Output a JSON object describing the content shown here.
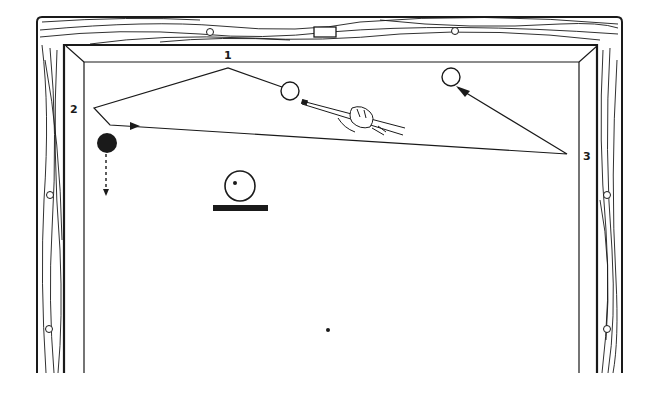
{
  "diagram": {
    "colors": {
      "ink": "#1a1a1a",
      "paper": "#ffffff"
    },
    "cushion_labels": [
      {
        "id": "1",
        "text": "1",
        "x": 228,
        "y": 58
      },
      {
        "id": "2",
        "text": "2",
        "x": 75,
        "y": 113
      },
      {
        "id": "3",
        "text": "3",
        "x": 587,
        "y": 159
      }
    ],
    "balls": [
      {
        "name": "cue-ball",
        "x": 290,
        "y": 91,
        "r": 9,
        "fill": "none"
      },
      {
        "name": "object-ball-target",
        "x": 451,
        "y": 77,
        "r": 9,
        "fill": "none"
      },
      {
        "name": "object-ball-black",
        "x": 107,
        "y": 143,
        "r": 10,
        "fill": "#1a1a1a"
      }
    ],
    "shot_path": [
      [
        290,
        90
      ],
      [
        228,
        68
      ],
      [
        94,
        108
      ],
      [
        110,
        125
      ],
      [
        567,
        154
      ],
      [
        458,
        88
      ]
    ],
    "inset": {
      "ball_x": 240,
      "ball_y": 185,
      "ball_r": 15,
      "dot_x": 235,
      "dot_y": 183
    },
    "center_spot": {
      "x": 328,
      "y": 330
    }
  }
}
